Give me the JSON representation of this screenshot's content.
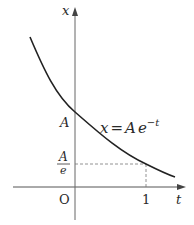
{
  "diagram": {
    "axes": {
      "x_axis_label": "t",
      "y_axis_label": "x",
      "origin_label": "O"
    },
    "ticks": {
      "t_tick": "1",
      "x_tick_A": "A",
      "x_tick_A_over_e_num": "A",
      "x_tick_A_over_e_den": "e"
    },
    "curve": {
      "equation_lhs": "x",
      "equation_eq": "=",
      "equation_A": "A",
      "equation_base": "e",
      "equation_exp": "−t",
      "equation_full": "x = A e^{-t}"
    },
    "colors": {
      "ink": "#2a2a2a",
      "axis": "#555555",
      "dashed": "#777777",
      "background": "#ffffff"
    }
  }
}
